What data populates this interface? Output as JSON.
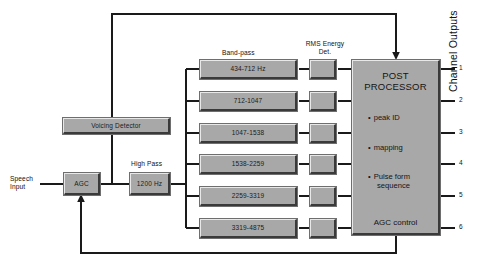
{
  "diagram": {
    "colors": {
      "block_fill": "#a8a8a8",
      "block_shadow": "#3a3a3a",
      "block_highlight": "#e8e8e8",
      "wire": "#1a1a1a",
      "background": "#ffffff",
      "text": "#111111"
    }
  },
  "labels": {
    "speech_input": "Speech\nInput",
    "band_pass_group": "Band-pass",
    "rms_group": "RMS Energy\nDet.",
    "high_pass": "High Pass",
    "channel_outputs": "Channel Outputs"
  },
  "blocks": {
    "agc": "AGC",
    "high_pass": "1200 Hz",
    "voicing_detector": "Voicing Detector"
  },
  "band_pass_filters": [
    {
      "label": "434-712 Hz",
      "channel": "1"
    },
    {
      "label": "712-1047",
      "channel": "2"
    },
    {
      "label": "1047-1538",
      "channel": "3"
    },
    {
      "label": "1538-2259",
      "channel": "4"
    },
    {
      "label": "2259-3319",
      "channel": "5"
    },
    {
      "label": "3319-4875",
      "channel": "6"
    }
  ],
  "rms_detectors": [
    {
      "label": ""
    },
    {
      "label": ""
    },
    {
      "label": ""
    },
    {
      "label": ""
    },
    {
      "label": ""
    },
    {
      "label": ""
    }
  ],
  "post_processor": {
    "title": "POST\nPROCESSOR",
    "bullets": [
      {
        "dot": "•",
        "text": "peak ID",
        "continuation": ""
      },
      {
        "dot": "•",
        "text": "mapping",
        "continuation": ""
      },
      {
        "dot": "•",
        "text": "Pulse form",
        "continuation": "sequence"
      }
    ],
    "footer": "AGC control"
  },
  "channel_numbers": [
    "1",
    "2",
    "3",
    "4",
    "5",
    "6"
  ]
}
